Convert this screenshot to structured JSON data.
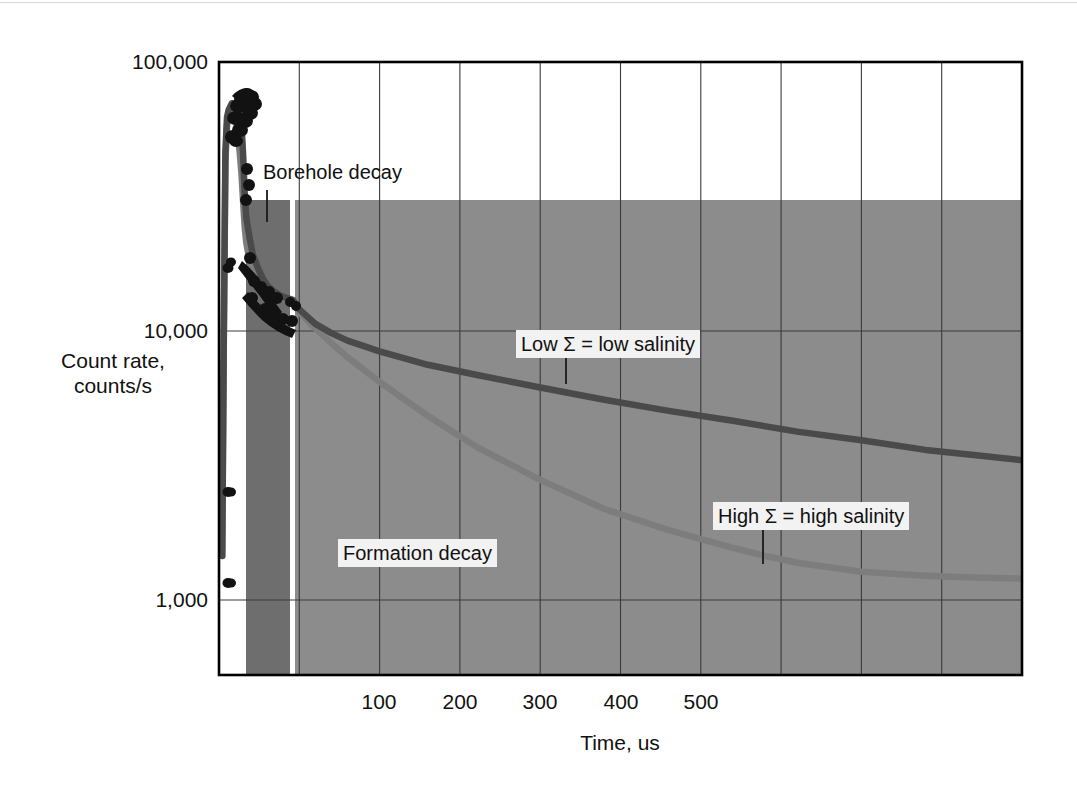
{
  "chart_data": {
    "type": "line",
    "title": "",
    "subtitle": "",
    "xlabel": "Time, us",
    "ylabel": "Count rate,\ncounts/s",
    "ylabel_line1": "Count rate,",
    "ylabel_line2": "counts/s",
    "yscale": "log",
    "xscale": "linear",
    "xlim": [
      0,
      500
    ],
    "ylim": [
      500,
      100000
    ],
    "grid": true,
    "grid_x_minor_step": 50,
    "y_tick_labels": [
      "100,000",
      "10,000",
      "1,000"
    ],
    "y_ticks": [
      100000,
      10000,
      1000
    ],
    "x_tick_labels": [
      "100",
      "200",
      "300",
      "400",
      "500"
    ],
    "x_ticks": [
      100,
      200,
      300,
      400,
      500
    ],
    "legend_position": "inline-annotations",
    "annotations": [
      {
        "id": "borehole-decay",
        "text": "Borehole decay",
        "boxed": false,
        "leader": true
      },
      {
        "id": "formation-decay",
        "text": "Formation decay",
        "boxed": true,
        "leader": false
      },
      {
        "id": "low-sigma",
        "text": "Low Σ = low salinity",
        "boxed": true,
        "leader": true
      },
      {
        "id": "high-sigma",
        "text": "High Σ = high salinity",
        "boxed": true,
        "leader": true
      }
    ],
    "shaded_regions": [
      {
        "id": "borehole-window",
        "label": "Borehole decay gate",
        "x_start": 17,
        "x_end": 41,
        "color": "#6e6e6e"
      },
      {
        "id": "formation-window",
        "label": "Formation decay gate",
        "x_start": 44,
        "x_end": 500,
        "color": "#8c8c8c"
      }
    ],
    "series": [
      {
        "name": "Low Σ = low salinity",
        "color": "#4a4a4a",
        "style": "solid",
        "has_markers": true,
        "description": "Burst rise, borehole decay, then slow formation decay",
        "points": [
          [
            2,
            1400
          ],
          [
            3,
            9500
          ],
          [
            4,
            46000
          ],
          [
            5,
            62000
          ],
          [
            6,
            66000
          ],
          [
            7,
            68000
          ],
          [
            8,
            70000
          ],
          [
            9,
            70000
          ],
          [
            10,
            69000
          ],
          [
            11,
            66000
          ],
          [
            12,
            63000
          ],
          [
            13,
            60000
          ],
          [
            14,
            58000
          ],
          [
            15,
            45000
          ],
          [
            16,
            32000
          ],
          [
            17,
            26000
          ],
          [
            19,
            22000
          ],
          [
            21,
            19000
          ],
          [
            24,
            17000
          ],
          [
            27,
            15500
          ],
          [
            30,
            14500
          ],
          [
            34,
            13800
          ],
          [
            38,
            13300
          ],
          [
            42,
            13000
          ],
          [
            46,
            12800
          ],
          [
            50,
            11800
          ],
          [
            60,
            10400
          ],
          [
            70,
            9600
          ],
          [
            80,
            9000
          ],
          [
            100,
            8200
          ],
          [
            130,
            7300
          ],
          [
            160,
            6700
          ],
          [
            200,
            6000
          ],
          [
            240,
            5400
          ],
          [
            280,
            4900
          ],
          [
            320,
            4500
          ],
          [
            360,
            4100
          ],
          [
            400,
            3800
          ],
          [
            440,
            3500
          ],
          [
            470,
            3350
          ],
          [
            500,
            3200
          ]
        ]
      },
      {
        "name": "High Σ = high salinity",
        "color": "#7d7d7d",
        "style": "solid",
        "has_markers": true,
        "description": "Burst rise, borehole decay, then fast formation decay",
        "points": [
          [
            2,
            1400
          ],
          [
            3,
            9000
          ],
          [
            4,
            42000
          ],
          [
            5,
            58000
          ],
          [
            6,
            62000
          ],
          [
            7,
            64000
          ],
          [
            8,
            65000
          ],
          [
            9,
            64000
          ],
          [
            10,
            62000
          ],
          [
            11,
            58000
          ],
          [
            12,
            52000
          ],
          [
            13,
            45000
          ],
          [
            14,
            38000
          ],
          [
            15,
            30000
          ],
          [
            16,
            24000
          ],
          [
            17,
            21000
          ],
          [
            19,
            18000
          ],
          [
            21,
            16000
          ],
          [
            24,
            14800
          ],
          [
            27,
            14000
          ],
          [
            30,
            13500
          ],
          [
            34,
            13200
          ],
          [
            38,
            13000
          ],
          [
            42,
            12900
          ],
          [
            46,
            12500
          ],
          [
            50,
            11500
          ],
          [
            60,
            10000
          ],
          [
            70,
            8800
          ],
          [
            80,
            7800
          ],
          [
            100,
            6300
          ],
          [
            130,
            4700
          ],
          [
            160,
            3600
          ],
          [
            200,
            2700
          ],
          [
            240,
            2100
          ],
          [
            280,
            1750
          ],
          [
            320,
            1500
          ],
          [
            340,
            1400
          ],
          [
            360,
            1320
          ],
          [
            400,
            1220
          ],
          [
            440,
            1180
          ],
          [
            470,
            1160
          ],
          [
            500,
            1150
          ]
        ]
      }
    ]
  },
  "colors": {
    "background": "#ffffff",
    "axis": "#000000",
    "gridline": "#3a3a3a",
    "borehole_band": "#6e6e6e",
    "formation_band": "#8c8c8c",
    "low_sigma_curve": "#4a4a4a",
    "high_sigma_curve": "#7d7d7d",
    "callout_box": "#f2f2f2",
    "text": "#111111"
  }
}
